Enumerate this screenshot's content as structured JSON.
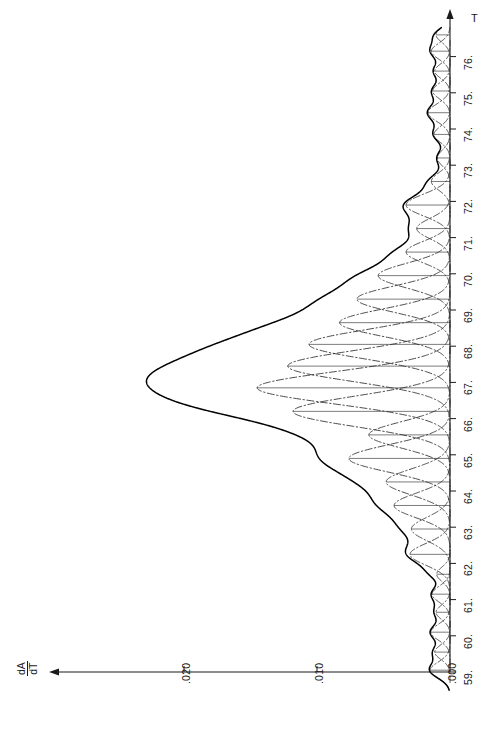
{
  "chart_data": {
    "type": "line",
    "title": "",
    "orientation": "rotated-90",
    "xlabel": "T",
    "ylabel": "dA/dT",
    "xlim": [
      58.5,
      76.8
    ],
    "ylim": [
      0.0,
      0.0255
    ],
    "grid": false,
    "legend": "none",
    "x_ticks": [
      {
        "value": 59,
        "label": "59."
      },
      {
        "value": 60,
        "label": "60."
      },
      {
        "value": 61,
        "label": "61."
      },
      {
        "value": 62,
        "label": "62."
      },
      {
        "value": 63,
        "label": "63."
      },
      {
        "value": 64,
        "label": "64."
      },
      {
        "value": 65,
        "label": "65."
      },
      {
        "value": 66,
        "label": "66."
      },
      {
        "value": 67,
        "label": "67."
      },
      {
        "value": 68,
        "label": "68."
      },
      {
        "value": 69,
        "label": "69."
      },
      {
        "value": 70,
        "label": "70."
      },
      {
        "value": 71,
        "label": "71."
      },
      {
        "value": 72,
        "label": "72."
      },
      {
        "value": 73,
        "label": "73."
      },
      {
        "value": 74,
        "label": "74."
      },
      {
        "value": 75,
        "label": "75."
      },
      {
        "value": 76,
        "label": "76."
      }
    ],
    "y_ticks": [
      {
        "value": 0.0,
        "label": ".000"
      },
      {
        "value": 0.01,
        "label": ".010"
      },
      {
        "value": 0.02,
        "label": ".020"
      }
    ],
    "series": [
      {
        "name": "envelope",
        "style": "solid",
        "color": "#000000",
        "description": "Sum of all Gaussian components (measured derivative melting curve)"
      },
      {
        "name": "components",
        "style": "dash-dot",
        "color": "#333333",
        "description": "Individual deconvolved Gaussian sub-transitions"
      }
    ],
    "components": [
      {
        "center": 59.05,
        "amplitude": 0.0015,
        "sigma": 0.22
      },
      {
        "center": 59.55,
        "amplitude": 0.00115,
        "sigma": 0.2
      },
      {
        "center": 60.1,
        "amplitude": 0.00145,
        "sigma": 0.22
      },
      {
        "center": 60.65,
        "amplitude": 0.00105,
        "sigma": 0.2
      },
      {
        "center": 61.15,
        "amplitude": 0.00135,
        "sigma": 0.22
      },
      {
        "center": 61.7,
        "amplitude": 0.001,
        "sigma": 0.2
      },
      {
        "center": 62.25,
        "amplitude": 0.003,
        "sigma": 0.3
      },
      {
        "center": 62.95,
        "amplitude": 0.0029,
        "sigma": 0.32
      },
      {
        "center": 63.6,
        "amplitude": 0.0042,
        "sigma": 0.34
      },
      {
        "center": 64.25,
        "amplitude": 0.0048,
        "sigma": 0.36
      },
      {
        "center": 64.9,
        "amplitude": 0.0076,
        "sigma": 0.38
      },
      {
        "center": 65.55,
        "amplitude": 0.0061,
        "sigma": 0.36
      },
      {
        "center": 66.2,
        "amplitude": 0.0118,
        "sigma": 0.42
      },
      {
        "center": 66.85,
        "amplitude": 0.0145,
        "sigma": 0.44
      },
      {
        "center": 67.45,
        "amplitude": 0.0122,
        "sigma": 0.42
      },
      {
        "center": 68.05,
        "amplitude": 0.0106,
        "sigma": 0.4
      },
      {
        "center": 68.65,
        "amplitude": 0.0083,
        "sigma": 0.38
      },
      {
        "center": 69.3,
        "amplitude": 0.007,
        "sigma": 0.36
      },
      {
        "center": 69.95,
        "amplitude": 0.0054,
        "sigma": 0.34
      },
      {
        "center": 70.6,
        "amplitude": 0.0033,
        "sigma": 0.3
      },
      {
        "center": 71.25,
        "amplitude": 0.0025,
        "sigma": 0.28
      },
      {
        "center": 71.9,
        "amplitude": 0.0033,
        "sigma": 0.3
      },
      {
        "center": 72.55,
        "amplitude": 0.0014,
        "sigma": 0.24
      },
      {
        "center": 73.2,
        "amplitude": 0.00095,
        "sigma": 0.22
      },
      {
        "center": 73.85,
        "amplitude": 0.0012,
        "sigma": 0.22
      },
      {
        "center": 74.45,
        "amplitude": 0.00165,
        "sigma": 0.24
      },
      {
        "center": 75.05,
        "amplitude": 0.0013,
        "sigma": 0.22
      },
      {
        "center": 75.6,
        "amplitude": 0.00115,
        "sigma": 0.2
      },
      {
        "center": 76.15,
        "amplitude": 0.0014,
        "sigma": 0.22
      },
      {
        "center": 76.6,
        "amplitude": 0.00105,
        "sigma": 0.2
      }
    ],
    "peak_maximum": {
      "x": 66.85,
      "y": 0.0235
    },
    "axis_arrows": {
      "x_axis_arrow": "up",
      "y_axis_arrow": "left"
    }
  }
}
